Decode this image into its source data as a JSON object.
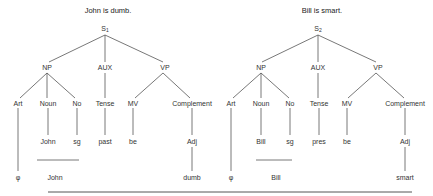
{
  "trees": [
    {
      "title": "John is dumb.",
      "root": {
        "label": "S",
        "sub": "1"
      },
      "level1": [
        "NP",
        "AUX",
        "VP"
      ],
      "level2": [
        "Art",
        "Noun",
        "No",
        "Tense",
        "MV",
        "Complement"
      ],
      "level3": [
        "John",
        "sg",
        "past",
        "be",
        "Adj"
      ],
      "level4": [
        "φ",
        "John",
        "dumb"
      ]
    },
    {
      "title": "Bill is smart.",
      "root": {
        "label": "S",
        "sub": "2"
      },
      "level1": [
        "NP",
        "AUX",
        "VP"
      ],
      "level2": [
        "Art",
        "Noun",
        "No",
        "Tense",
        "MV",
        "Complement"
      ],
      "level3": [
        "Bill",
        "sg",
        "pres",
        "be",
        "Adj"
      ],
      "level4": [
        "φ",
        "Bill",
        "smart"
      ]
    }
  ],
  "colors": {
    "line": "#555555",
    "text": "#333333"
  }
}
